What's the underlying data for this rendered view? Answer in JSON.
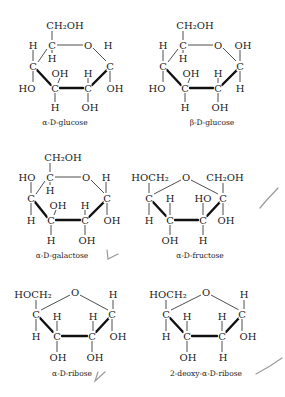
{
  "structures": [
    {
      "name": "alpha-D-glucose",
      "label": "α-D-glucose",
      "label_pos": [
        65,
        125
      ],
      "atoms": [
        {
          "t": "CH₂OH",
          "x": 65,
          "y": 25
        },
        {
          "t": "H",
          "x": 33,
          "y": 45
        },
        {
          "t": "C",
          "x": 52,
          "y": 45
        },
        {
          "t": "O",
          "x": 88,
          "y": 45
        },
        {
          "t": "H",
          "x": 108,
          "y": 45
        },
        {
          "t": "H",
          "x": 52,
          "y": 58
        },
        {
          "t": "C",
          "x": 33,
          "y": 66
        },
        {
          "t": "C",
          "x": 110,
          "y": 66
        },
        {
          "t": "OH",
          "x": 60,
          "y": 73
        },
        {
          "t": "H",
          "x": 88,
          "y": 73
        },
        {
          "t": "HO",
          "x": 27,
          "y": 88
        },
        {
          "t": "C",
          "x": 55,
          "y": 88
        },
        {
          "t": "C",
          "x": 88,
          "y": 88
        },
        {
          "t": "OH",
          "x": 115,
          "y": 88
        },
        {
          "t": "H",
          "x": 55,
          "y": 107
        },
        {
          "t": "OH",
          "x": 90,
          "y": 107
        }
      ],
      "bonds": [
        [
          52,
          31,
          52,
          40
        ],
        [
          33,
          50,
          33,
          61
        ],
        [
          52,
          50,
          52,
          53
        ],
        [
          57,
          45,
          83,
          45
        ],
        [
          93,
          48,
          106,
          61
        ],
        [
          38,
          62,
          47,
          49
        ],
        [
          108,
          50,
          108,
          40
        ],
        [
          110,
          71,
          110,
          82
        ],
        [
          33,
          71,
          33,
          82
        ],
        [
          60,
          78,
          58,
          83
        ],
        [
          88,
          78,
          88,
          83
        ],
        [
          55,
          93,
          55,
          102
        ],
        [
          88,
          93,
          88,
          102
        ]
      ],
      "bold": [
        [
          37,
          70,
          51,
          85
        ],
        [
          60,
          88,
          83,
          88
        ],
        [
          92,
          85,
          107,
          70
        ]
      ]
    },
    {
      "name": "beta-D-glucose",
      "label": "β-D-glucose",
      "label_pos": [
        212,
        125
      ],
      "atoms": [
        {
          "t": "CH₂OH",
          "x": 195,
          "y": 25
        },
        {
          "t": "H",
          "x": 163,
          "y": 45
        },
        {
          "t": "C",
          "x": 183,
          "y": 45
        },
        {
          "t": "O",
          "x": 218,
          "y": 45
        },
        {
          "t": "OH",
          "x": 243,
          "y": 45
        },
        {
          "t": "H",
          "x": 183,
          "y": 58
        },
        {
          "t": "C",
          "x": 163,
          "y": 66
        },
        {
          "t": "C",
          "x": 240,
          "y": 66
        },
        {
          "t": "OH",
          "x": 191,
          "y": 73
        },
        {
          "t": "H",
          "x": 218,
          "y": 73
        },
        {
          "t": "HO",
          "x": 157,
          "y": 88
        },
        {
          "t": "C",
          "x": 185,
          "y": 88
        },
        {
          "t": "C",
          "x": 218,
          "y": 88
        },
        {
          "t": "H",
          "x": 240,
          "y": 88
        },
        {
          "t": "H",
          "x": 185,
          "y": 107
        },
        {
          "t": "OH",
          "x": 220,
          "y": 107
        }
      ],
      "bonds": [
        [
          183,
          31,
          183,
          40
        ],
        [
          163,
          50,
          163,
          61
        ],
        [
          183,
          50,
          183,
          53
        ],
        [
          188,
          45,
          213,
          45
        ],
        [
          223,
          48,
          236,
          61
        ],
        [
          168,
          62,
          178,
          49
        ],
        [
          240,
          50,
          240,
          61
        ],
        [
          240,
          71,
          240,
          82
        ],
        [
          163,
          71,
          163,
          82
        ],
        [
          190,
          78,
          188,
          83
        ],
        [
          218,
          78,
          218,
          83
        ],
        [
          185,
          93,
          185,
          102
        ],
        [
          218,
          93,
          218,
          102
        ]
      ],
      "bold": [
        [
          167,
          70,
          181,
          85
        ],
        [
          190,
          88,
          213,
          88
        ],
        [
          222,
          85,
          237,
          70
        ]
      ]
    },
    {
      "name": "alpha-D-galactose",
      "label": "α-D-galactose",
      "label_pos": [
        62,
        258
      ],
      "atoms": [
        {
          "t": "CH₂OH",
          "x": 63,
          "y": 157
        },
        {
          "t": "HO",
          "x": 27,
          "y": 177
        },
        {
          "t": "C",
          "x": 50,
          "y": 177
        },
        {
          "t": "O",
          "x": 86,
          "y": 177
        },
        {
          "t": "H",
          "x": 106,
          "y": 177
        },
        {
          "t": "H",
          "x": 50,
          "y": 190
        },
        {
          "t": "C",
          "x": 31,
          "y": 198
        },
        {
          "t": "C",
          "x": 107,
          "y": 198
        },
        {
          "t": "OH",
          "x": 58,
          "y": 205
        },
        {
          "t": "H",
          "x": 85,
          "y": 205
        },
        {
          "t": "H",
          "x": 31,
          "y": 220
        },
        {
          "t": "C",
          "x": 51,
          "y": 220
        },
        {
          "t": "C",
          "x": 85,
          "y": 220
        },
        {
          "t": "OH",
          "x": 112,
          "y": 220
        },
        {
          "t": "H",
          "x": 51,
          "y": 240
        },
        {
          "t": "OH",
          "x": 87,
          "y": 240
        }
      ],
      "bonds": [
        [
          50,
          163,
          50,
          172
        ],
        [
          31,
          182,
          31,
          193
        ],
        [
          50,
          182,
          50,
          185
        ],
        [
          55,
          177,
          81,
          177
        ],
        [
          91,
          180,
          104,
          193
        ],
        [
          36,
          194,
          45,
          181
        ],
        [
          106,
          182,
          106,
          193
        ],
        [
          107,
          203,
          107,
          215
        ],
        [
          31,
          203,
          31,
          215
        ],
        [
          56,
          210,
          54,
          215
        ],
        [
          85,
          210,
          85,
          215
        ],
        [
          51,
          225,
          51,
          235
        ],
        [
          85,
          225,
          85,
          235
        ]
      ],
      "bold": [
        [
          35,
          202,
          47,
          217
        ],
        [
          56,
          220,
          80,
          220
        ],
        [
          89,
          217,
          104,
          202
        ]
      ]
    },
    {
      "name": "alpha-D-fructose",
      "label": "α-D-fructose",
      "label_pos": [
        200,
        258
      ],
      "atoms": [
        {
          "t": "HOCH₂",
          "x": 150,
          "y": 177
        },
        {
          "t": "O",
          "x": 186,
          "y": 177
        },
        {
          "t": "CH₂OH",
          "x": 225,
          "y": 177
        },
        {
          "t": "C",
          "x": 149,
          "y": 198
        },
        {
          "t": "H",
          "x": 170,
          "y": 198
        },
        {
          "t": "HO",
          "x": 203,
          "y": 198
        },
        {
          "t": "C",
          "x": 223,
          "y": 198
        },
        {
          "t": "H",
          "x": 149,
          "y": 220
        },
        {
          "t": "C",
          "x": 170,
          "y": 220
        },
        {
          "t": "C",
          "x": 203,
          "y": 220
        },
        {
          "t": "OH",
          "x": 226,
          "y": 220
        },
        {
          "t": "OH",
          "x": 170,
          "y": 240
        },
        {
          "t": "H",
          "x": 203,
          "y": 240
        }
      ],
      "bonds": [
        [
          149,
          183,
          149,
          193
        ],
        [
          154,
          194,
          181,
          180
        ],
        [
          191,
          180,
          218,
          194
        ],
        [
          223,
          183,
          223,
          193
        ],
        [
          149,
          203,
          149,
          215
        ],
        [
          170,
          203,
          170,
          215
        ],
        [
          203,
          203,
          203,
          215
        ],
        [
          223,
          203,
          223,
          215
        ],
        [
          170,
          225,
          170,
          235
        ],
        [
          203,
          225,
          203,
          235
        ]
      ],
      "bold": [
        [
          153,
          202,
          166,
          216
        ],
        [
          175,
          220,
          198,
          220
        ],
        [
          207,
          216,
          220,
          202
        ]
      ]
    },
    {
      "name": "alpha-D-ribose",
      "label": "α-D-ribose",
      "label_pos": [
        72,
        376
      ],
      "atoms": [
        {
          "t": "HOCH₂",
          "x": 33,
          "y": 294
        },
        {
          "t": "O",
          "x": 75,
          "y": 292
        },
        {
          "t": "H",
          "x": 113,
          "y": 294
        },
        {
          "t": "C",
          "x": 36,
          "y": 314
        },
        {
          "t": "H",
          "x": 57,
          "y": 316
        },
        {
          "t": "H",
          "x": 93,
          "y": 316
        },
        {
          "t": "C",
          "x": 112,
          "y": 314
        },
        {
          "t": "H",
          "x": 36,
          "y": 336
        },
        {
          "t": "C",
          "x": 57,
          "y": 336
        },
        {
          "t": "C",
          "x": 92,
          "y": 336
        },
        {
          "t": "OH",
          "x": 118,
          "y": 336
        },
        {
          "t": "OH",
          "x": 58,
          "y": 357
        },
        {
          "t": "OH",
          "x": 95,
          "y": 357
        }
      ],
      "bonds": [
        [
          36,
          300,
          36,
          309
        ],
        [
          41,
          310,
          70,
          295
        ],
        [
          80,
          295,
          108,
          310
        ],
        [
          113,
          300,
          113,
          309
        ],
        [
          36,
          319,
          36,
          331
        ],
        [
          57,
          321,
          57,
          331
        ],
        [
          93,
          321,
          93,
          331
        ],
        [
          112,
          319,
          112,
          331
        ],
        [
          57,
          341,
          57,
          352
        ],
        [
          92,
          341,
          92,
          352
        ]
      ],
      "bold": [
        [
          40,
          318,
          53,
          332
        ],
        [
          62,
          336,
          87,
          336
        ],
        [
          96,
          332,
          109,
          318
        ]
      ]
    },
    {
      "name": "2-deoxy-alpha-D-ribose",
      "label": "2-deoxy-α-D-ribose",
      "label_pos": [
        206,
        376
      ],
      "atoms": [
        {
          "t": "HOCH₂",
          "x": 168,
          "y": 294
        },
        {
          "t": "O",
          "x": 206,
          "y": 292
        },
        {
          "t": "H",
          "x": 244,
          "y": 294
        },
        {
          "t": "C",
          "x": 166,
          "y": 314
        },
        {
          "t": "H",
          "x": 187,
          "y": 316
        },
        {
          "t": "H",
          "x": 222,
          "y": 316
        },
        {
          "t": "C",
          "x": 242,
          "y": 314
        },
        {
          "t": "H",
          "x": 166,
          "y": 336
        },
        {
          "t": "C",
          "x": 187,
          "y": 336
        },
        {
          "t": "C",
          "x": 222,
          "y": 336
        },
        {
          "t": "OH",
          "x": 248,
          "y": 336
        },
        {
          "t": "OH",
          "x": 188,
          "y": 357
        },
        {
          "t": "H",
          "x": 223,
          "y": 357
        }
      ],
      "bonds": [
        [
          166,
          300,
          166,
          309
        ],
        [
          171,
          310,
          201,
          295
        ],
        [
          211,
          295,
          239,
          310
        ],
        [
          244,
          300,
          244,
          309
        ],
        [
          166,
          319,
          166,
          331
        ],
        [
          187,
          321,
          187,
          331
        ],
        [
          222,
          321,
          222,
          331
        ],
        [
          242,
          319,
          242,
          331
        ],
        [
          187,
          341,
          187,
          352
        ],
        [
          222,
          341,
          222,
          352
        ]
      ],
      "bold": [
        [
          170,
          318,
          183,
          332
        ],
        [
          192,
          336,
          217,
          336
        ],
        [
          226,
          332,
          239,
          318
        ]
      ]
    }
  ],
  "check_marks": [
    {
      "points": "107,250 108,259 118,254"
    },
    {
      "points": "260,208 265,202 278,188"
    },
    {
      "points": "98,372 95,381 105,372"
    },
    {
      "points": "256,374 270,366 282,358"
    }
  ]
}
